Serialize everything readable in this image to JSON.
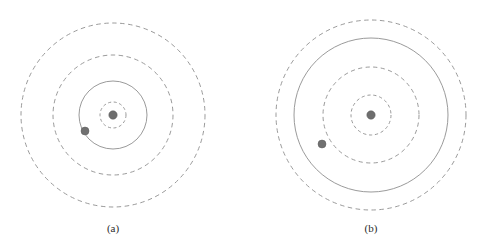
{
  "figure": {
    "background_color": "#ffffff",
    "stroke_color": "#8f8f8f",
    "nucleus_color": "#6e6e6e",
    "electron_color": "#707070",
    "caption_color": "#2b2b2b",
    "width": 502,
    "height": 243
  },
  "panels": [
    {
      "id": "panel-a",
      "caption": "(a)",
      "caption_x": 113,
      "caption_y": 232,
      "center_x": 113,
      "center_y": 115,
      "nucleus": {
        "x": 113,
        "y": 115,
        "r": 4.2,
        "label": "nucleus"
      },
      "electron": {
        "x": 85,
        "y": 131,
        "r": 4.0,
        "label": "electron"
      },
      "orbits": [
        {
          "name": "inner-dashed-shell",
          "r": 13,
          "style": "dashed"
        },
        {
          "name": "electron-orbit",
          "r": 34,
          "style": "solid"
        },
        {
          "name": "middle-dashed-shell",
          "r": 60,
          "style": "dashed"
        },
        {
          "name": "outer-dashed-shell",
          "r": 92,
          "style": "dashed"
        }
      ]
    },
    {
      "id": "panel-b",
      "caption": "(b)",
      "caption_x": 371,
      "caption_y": 232,
      "center_x": 371,
      "center_y": 115,
      "nucleus": {
        "x": 371,
        "y": 115,
        "r": 4.2,
        "label": "nucleus"
      },
      "electron": {
        "x": 322,
        "y": 144,
        "r": 4.0,
        "label": "electron"
      },
      "orbits": [
        {
          "name": "inner-dashed-shell",
          "r": 20,
          "style": "dashed"
        },
        {
          "name": "middle-dashed-shell",
          "r": 48,
          "style": "dashed"
        },
        {
          "name": "electron-orbit",
          "r": 77,
          "style": "solid"
        },
        {
          "name": "outer-dashed-shell",
          "r": 95,
          "style": "dashed"
        }
      ]
    }
  ]
}
